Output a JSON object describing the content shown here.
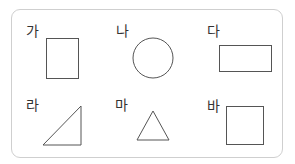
{
  "figure": {
    "border_color": "#cfcfcf",
    "stroke_color": "#555555",
    "items": [
      {
        "label": "가",
        "shape": "rectangle-portrait"
      },
      {
        "label": "나",
        "shape": "circle"
      },
      {
        "label": "다",
        "shape": "rectangle-landscape"
      },
      {
        "label": "라",
        "shape": "right-triangle"
      },
      {
        "label": "마",
        "shape": "isosceles-triangle"
      },
      {
        "label": "바",
        "shape": "square"
      }
    ]
  }
}
